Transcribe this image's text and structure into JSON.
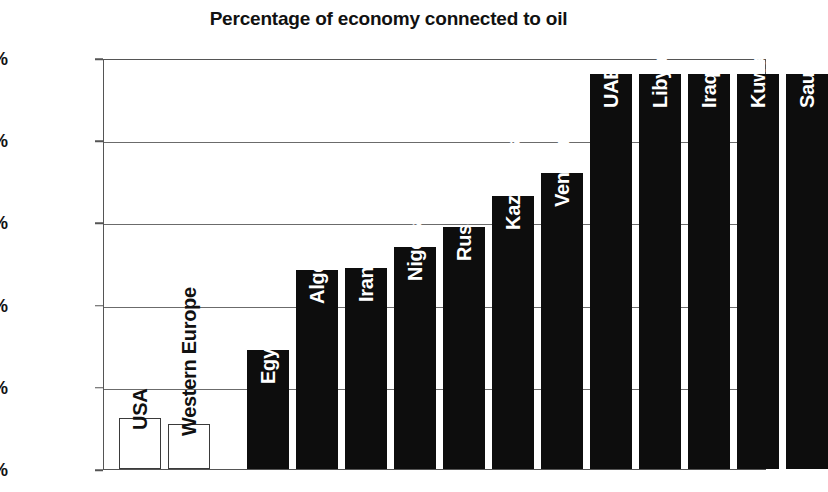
{
  "chart_data": {
    "type": "bar",
    "title": "Percentage of economy connected to oil",
    "xlabel": "",
    "ylabel": "",
    "ylim": [
      0,
      100
    ],
    "grid": true,
    "legend": "none",
    "yticks": [
      "0%",
      "20%",
      "40%",
      "60%",
      "80%",
      "100%"
    ],
    "ytick_values": [
      0,
      20,
      40,
      60,
      80,
      100
    ],
    "categories": [
      "USA",
      "Western Europe",
      "Egypt",
      "Algeria",
      "Iran",
      "Nigeria",
      "Russia",
      "Kazakhstan",
      "Venezuela",
      "UAE",
      "Libya",
      "Iraq",
      "Kuwait",
      "Saudi Arabia"
    ],
    "values": [
      12.5,
      11,
      29,
      48.5,
      49,
      54,
      59,
      66.5,
      72,
      96,
      96,
      96,
      96,
      96
    ],
    "bar_styles": [
      "hollow",
      "hollow",
      "filled",
      "filled",
      "filled",
      "filled",
      "filled",
      "filled",
      "filled",
      "filled",
      "filled",
      "filled",
      "filled",
      "filled"
    ],
    "label_placement": [
      "outside",
      "outside",
      "inside",
      "inside",
      "inside",
      "inside",
      "inside",
      "inside",
      "inside",
      "inside",
      "inside",
      "inside",
      "inside",
      "inside"
    ],
    "colors": {
      "bar_fill": "#0d0d0d",
      "bar_hollow_fill": "#ffffff",
      "bar_outline": "#3a3a3a",
      "grid": "#6b6b6b",
      "axis": "#555555",
      "text": "#111111",
      "label_on_bar": "#ffffff",
      "background": "#ffffff"
    }
  }
}
